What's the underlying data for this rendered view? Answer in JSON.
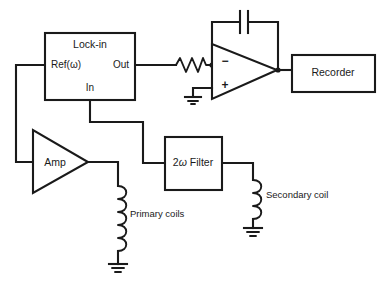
{
  "diagram": {
    "stroke_color": "#1a1a1a",
    "background": "#ffffff",
    "blocks": {
      "lockin": {
        "label": "Lock-in",
        "port_ref": "Ref(ω)",
        "port_out": "Out",
        "port_in": "In"
      },
      "recorder": {
        "label": "Recorder"
      },
      "amp": {
        "label": "Amp"
      },
      "filter": {
        "label_prefix": "2",
        "label_omega": "ω",
        "label_suffix": " Filter",
        "label_full": "2ω Filter"
      },
      "opamp": {
        "minus": "−",
        "plus": "+"
      }
    },
    "annotations": {
      "primary_coils": "Primary coils",
      "secondary_coil": "Secondary coil"
    },
    "components": {
      "resistor": "resistor-zigzag",
      "capacitor": "capacitor-feedback",
      "inductor_primary": "inductor-primary-coils",
      "inductor_secondary": "inductor-secondary-coil",
      "ground_opamp": "ground-symbol",
      "ground_primary": "ground-symbol",
      "ground_secondary": "ground-symbol"
    }
  }
}
